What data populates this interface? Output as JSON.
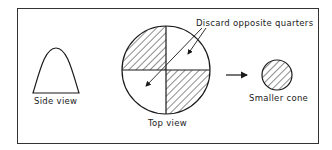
{
  "diagram": {
    "labels": {
      "side_view": "Side view",
      "top_view": "Top view",
      "discard": "Discard opposite quarters",
      "smaller_cone": "Smaller cone"
    },
    "colors": {
      "ink": "#1a1a1a",
      "background": "#ffffff",
      "frame": "#333333"
    },
    "elements": [
      {
        "id": "side-view-cone",
        "shape": "bell-curve",
        "caption": "Side view"
      },
      {
        "id": "top-view-circle",
        "shape": "circle-quartered",
        "hatched_quarters": [
          "top-left",
          "bottom-right"
        ],
        "caption": "Top view"
      },
      {
        "id": "discard-callout",
        "text": "Discard opposite quarters",
        "arrows_to": [
          "top-right",
          "bottom-left"
        ]
      },
      {
        "id": "transition-arrow",
        "shape": "arrow-right"
      },
      {
        "id": "smaller-cone",
        "shape": "circle-hatched",
        "caption": "Smaller cone"
      }
    ]
  }
}
